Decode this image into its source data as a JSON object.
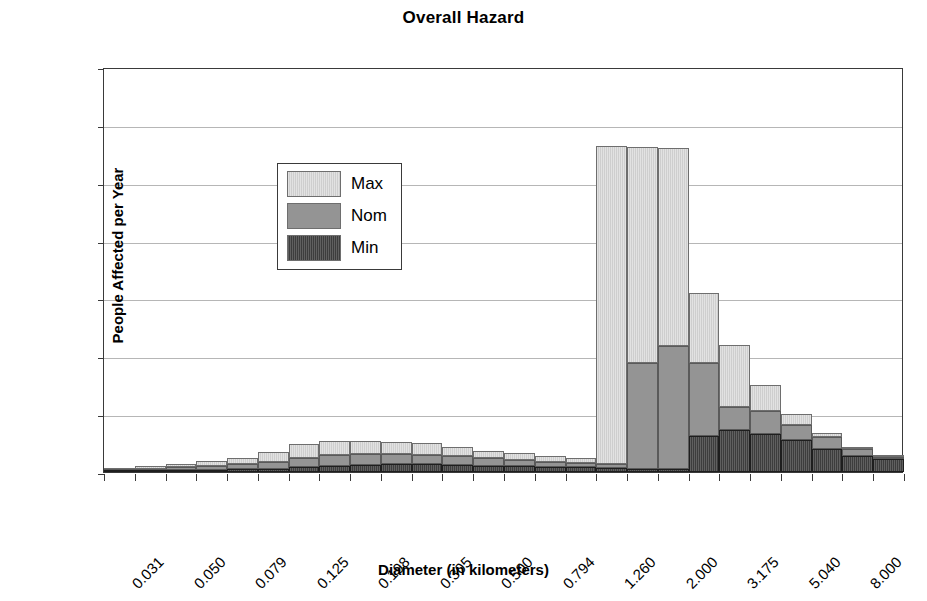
{
  "chart_data": {
    "type": "bar",
    "subtype": "stacked-histogram",
    "title": "Overall Hazard",
    "xlabel": "Diameter (in kilometers)",
    "ylabel": "People Affected per Year",
    "ylim": [
      0,
      700
    ],
    "yticks": [
      0,
      100,
      200,
      300,
      400,
      500,
      600,
      700
    ],
    "grid": true,
    "legend_position": "upper-left",
    "legend": [
      "Max",
      "Nom",
      "Min"
    ],
    "bar_count": 26,
    "xtick_labels": [
      "0.031",
      "0.050",
      "0.079",
      "0.125",
      "0.198",
      "0.305",
      "0.500",
      "0.794",
      "1.260",
      "2.000",
      "3.175",
      "5.040",
      "8.000"
    ],
    "xtick_label_interval": 2,
    "categories": [
      "0.031",
      "0.039",
      "0.050",
      "0.063",
      "0.079",
      "0.099",
      "0.125",
      "0.157",
      "0.198",
      "0.249",
      "0.305",
      "0.397",
      "0.500",
      "0.630",
      "0.794",
      "1.000",
      "1.260",
      "1.587",
      "2.000",
      "2.520",
      "3.175",
      "4.000",
      "5.040",
      "6.350",
      "8.000",
      "10.080"
    ],
    "series": [
      {
        "name": "Min",
        "color": "#3d3d3d",
        "values": [
          1,
          2,
          3,
          4,
          5,
          6,
          8,
          10,
          12,
          13,
          13,
          12,
          11,
          10,
          9,
          8,
          7,
          5,
          5,
          62,
          72,
          65,
          55,
          40,
          27,
          22
        ]
      },
      {
        "name": "Nom",
        "color": "#949494",
        "values": [
          3,
          4,
          5,
          7,
          9,
          12,
          17,
          19,
          19,
          18,
          17,
          15,
          13,
          11,
          9,
          8,
          7,
          183,
          213,
          126,
          40,
          40,
          27,
          20,
          13,
          4
        ]
      },
      {
        "name": "Max",
        "color": "#e2e2e2",
        "values": [
          3,
          4,
          6,
          8,
          11,
          17,
          23,
          25,
          23,
          21,
          20,
          16,
          13,
          12,
          10,
          8,
          550,
          374,
          342,
          122,
          107,
          45,
          18,
          7,
          4,
          1
        ]
      }
    ],
    "stack_totals": [
      7,
      10,
      14,
      19,
      25,
      35,
      48,
      54,
      54,
      52,
      50,
      43,
      37,
      33,
      28,
      24,
      564,
      562,
      644,
      557,
      430,
      312,
      219,
      150,
      100,
      62,
      44,
      27
    ]
  },
  "legend": {
    "items": [
      {
        "label": "Max",
        "swatch": "max-swatch"
      },
      {
        "label": "Nom",
        "swatch": "nom-swatch"
      },
      {
        "label": "Min",
        "swatch": "min-swatch"
      }
    ]
  },
  "colors": {
    "max": "#e2e2e2",
    "nom": "#949494",
    "min": "#3d3d3d",
    "axis": "#3a3a3a",
    "grid": "#b6b6b6",
    "background": "#ffffff"
  }
}
